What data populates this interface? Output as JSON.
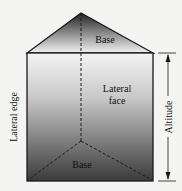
{
  "diagram": {
    "labels": {
      "top_base": "Base",
      "lateral_face_line1": "Lateral",
      "lateral_face_line2": "face",
      "bottom_base": "Base",
      "lateral_edge": "Lateral edge",
      "altitude": "Altitude"
    },
    "colors": {
      "background": "#f4f4f2",
      "edge": "#1a1a1a",
      "shade_dark": "#2a2a2a",
      "shade_light": "#f0f0f0"
    }
  }
}
